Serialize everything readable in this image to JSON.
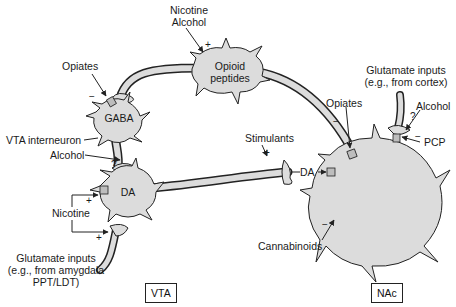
{
  "diagram": {
    "type": "neural-pathway",
    "colors": {
      "cell_fill": "#dcdcdc",
      "outline": "#222222",
      "background": "#ffffff"
    },
    "cells": {
      "gaba": {
        "label": "GABA"
      },
      "opioid": {
        "label_line1": "Opioid",
        "label_line2": "peptides"
      },
      "da": {
        "label": "DA"
      },
      "nac_neuron": {
        "label": ""
      }
    },
    "labels": {
      "nicotine_alcohol_top_1": "Nicotine",
      "nicotine_alcohol_top_2": "Alcohol",
      "opiates_left": "Opiates",
      "vta_interneuron": "VTA interneuron",
      "alcohol_left": "Alcohol",
      "nicotine_left": "Nicotine",
      "glutamate_left_1": "Glutamate inputs",
      "glutamate_left_2": "(e.g., from amygdala",
      "glutamate_left_3": "PPT/LDT)",
      "stimulants": "Stimulants",
      "da_release": "DA",
      "opiates_right": "Opiates",
      "glutamate_right_1": "Glutamate inputs",
      "glutamate_right_2": "(e.g., from cortex)",
      "alcohol_right": "Alcohol",
      "pcp": "PCP",
      "cannabinoids": "Cannabinoids"
    },
    "signs": {
      "opiates_left": "−",
      "nicotine_alcohol_top": "+",
      "alcohol_left": "?",
      "nicotine_upper": "+",
      "nicotine_lower": "+",
      "stimulants": "+",
      "opiates_right": "−",
      "alcohol_right_q": "?",
      "pcp": "−",
      "cannabinoids": "−"
    },
    "regions": {
      "vta": "VTA",
      "nac": "NAc"
    }
  }
}
